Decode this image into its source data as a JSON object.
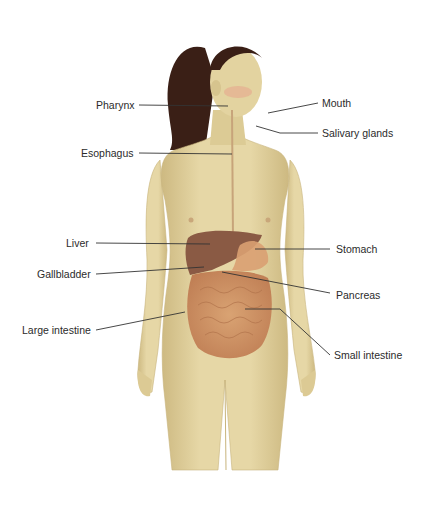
{
  "figure": {
    "colors": {
      "skin": "#e3d3a0",
      "skin_shade": "#cdb981",
      "hair": "#3a1f16",
      "liver": "#8a5a44",
      "stomach": "#d9a072",
      "intestine": "#d39a6a",
      "intestine_dark": "#b77a52",
      "leader_line": "#333333",
      "label_text": "#2b2b2b",
      "blush": "#e8a08a"
    },
    "labels_left": [
      {
        "id": "pharynx",
        "text": "Pharynx"
      },
      {
        "id": "esophagus",
        "text": "Esophagus"
      },
      {
        "id": "liver",
        "text": "Liver"
      },
      {
        "id": "gallbladder",
        "text": "Gallbladder"
      },
      {
        "id": "large-intestine",
        "text": "Large intestine"
      }
    ],
    "labels_right": [
      {
        "id": "mouth",
        "text": "Mouth"
      },
      {
        "id": "salivary-glands",
        "text": "Salivary glands"
      },
      {
        "id": "stomach",
        "text": "Stomach"
      },
      {
        "id": "pancreas",
        "text": "Pancreas"
      },
      {
        "id": "small-intestine",
        "text": "Small intestine"
      }
    ]
  }
}
